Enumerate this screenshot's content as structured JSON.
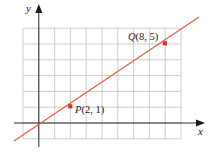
{
  "chart_data": {
    "type": "line",
    "title": "",
    "xlabel": "x",
    "ylabel": "y",
    "xlim": [
      -1,
      9
    ],
    "ylim": [
      -1,
      6
    ],
    "grid": true,
    "grid_step": 1,
    "line_color": "#e0604a",
    "point_color": "#d8342a",
    "series": [
      {
        "name": "line through P and Q",
        "x": [
          -1.5,
          10.3
        ],
        "y": [
          -0.75,
          7.1
        ]
      }
    ],
    "points": [
      {
        "label": "P",
        "x": 2,
        "y": 1,
        "text": "(2, 1)"
      },
      {
        "label": "Q",
        "x": 8,
        "y": 5,
        "text": "(8, 5)"
      }
    ]
  },
  "axes": {
    "x_label": "x",
    "y_label": "y"
  },
  "points": {
    "p": {
      "name": "P",
      "coords": "(2, 1)"
    },
    "q": {
      "name": "Q",
      "coords": "(8, 5)"
    }
  }
}
